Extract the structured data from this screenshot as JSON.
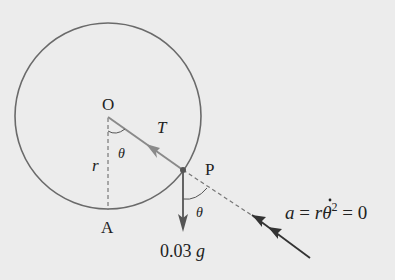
{
  "diagram": {
    "type": "physics free-body diagram",
    "points": {
      "center": {
        "label": "O",
        "x": 108,
        "y": 116
      },
      "particle": {
        "label": "P",
        "x": 183,
        "y": 170
      },
      "bottom": {
        "label": "A",
        "x": 108,
        "y": 210
      }
    },
    "circle": {
      "cx": 108,
      "cy": 116,
      "r": 93,
      "color": "#6a6a6a"
    },
    "labels": {
      "O": "O",
      "P": "P",
      "A": "A",
      "T": "T",
      "r": "r",
      "theta_top": "θ",
      "theta_bottom": "θ",
      "weight": "0.03 g",
      "weight_number": "0.03",
      "weight_symbol": "g",
      "accel_a": "a",
      "accel_eq1": " = ",
      "accel_r": "r",
      "accel_theta": "θ",
      "accel_exp": "2",
      "accel_eq2": " = 0"
    },
    "forces": [
      {
        "name": "tension",
        "label": "T",
        "direction": "P to O",
        "color": "#8a8a8a"
      },
      {
        "name": "weight",
        "label": "0.03 g",
        "direction": "downward",
        "color": "#555555"
      },
      {
        "name": "radial acceleration",
        "label": "a = rθ̇² = 0",
        "direction": "toward P along OP extension",
        "color": "#333333"
      }
    ],
    "colors": {
      "background": "#ececec",
      "circle": "#6a6a6a",
      "tension": "#8a8a8a",
      "weight": "#555555",
      "accel": "#333333",
      "dashed": "#777777"
    }
  }
}
